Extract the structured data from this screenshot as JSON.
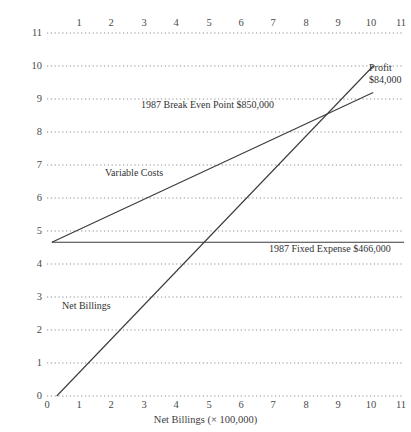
{
  "chart_data": {
    "type": "line",
    "title": "",
    "xlabel": "Net Billings (× 100,000)",
    "ylabel": "Cost & Expenses",
    "xlim": [
      0,
      11
    ],
    "ylim": [
      0,
      11
    ],
    "grid": true,
    "grid_style": "dotted",
    "legend_position": "inline-annotations",
    "x_ticks": [
      "0",
      "1",
      "2",
      "3",
      "4",
      "5",
      "6",
      "7",
      "8",
      "9",
      "10",
      "11"
    ],
    "x_ticks_top": [
      "1",
      "2",
      "3",
      "4",
      "5",
      "6",
      "7",
      "8",
      "9",
      "10",
      "11"
    ],
    "y_ticks": [
      "0",
      "1",
      "2",
      "3",
      "4",
      "5",
      "6",
      "7",
      "8",
      "9",
      "10",
      "11"
    ],
    "series": [
      {
        "name": "Net Billings",
        "points": [
          [
            0.3,
            0.0
          ],
          [
            10.05,
            10.0
          ]
        ],
        "label": "Net Billings",
        "color": "#3a3a3a"
      },
      {
        "name": "Variable Costs",
        "points": [
          [
            0.15,
            4.66
          ],
          [
            10.05,
            9.2
          ]
        ],
        "label": "Variable Costs",
        "color": "#3a3a3a"
      },
      {
        "name": "1987 Fixed Expense",
        "points": [
          [
            0.15,
            4.66
          ],
          [
            11.0,
            4.66
          ]
        ],
        "label": "1987 Fixed Expense $466,000",
        "value": 466000,
        "color": "#3a3a3a"
      }
    ],
    "annotations": [
      {
        "name": "break-even",
        "text": "1987 Break Even Point $850,000",
        "x": 8.5,
        "y": 8.5,
        "value": 850000
      },
      {
        "name": "variable-costs",
        "text": "Variable Costs",
        "x": 2.0,
        "y": 6.5
      },
      {
        "name": "fixed-expense",
        "text": "1987 Fixed Expense $466,000",
        "x": 7.5,
        "y": 4.66,
        "value": 466000
      },
      {
        "name": "net-billings",
        "text": "Net Billings",
        "x": 1.0,
        "y": 2.5
      },
      {
        "name": "profit",
        "text": "Profit $84,000",
        "line1": "Profit",
        "line2": "$84,000",
        "x": 10.3,
        "y": 9.6,
        "value": 84000
      }
    ]
  },
  "axes": {
    "x_title": "Net Billings (× 100,000)",
    "y_title": "Cost & Expenses"
  },
  "annotations": {
    "break_even": "1987 Break Even Point $850,000",
    "variable_costs": "Variable Costs",
    "fixed_expense": "1987 Fixed Expense $466,000",
    "net_billings": "Net Billings",
    "profit_line1": "Profit",
    "profit_line2": "$84,000"
  },
  "colors": {
    "grid": "#8f8f8f",
    "line": "#3a3a3a",
    "text": "#3a3a3a",
    "background": "#ffffff"
  }
}
